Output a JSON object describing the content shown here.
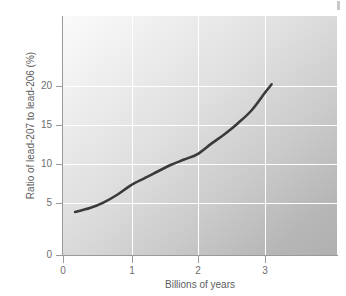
{
  "chart_data": {
    "type": "line",
    "title": "",
    "xlabel": "Billions of years",
    "ylabel": "Ratio of lead-207 to lead-206 (%)",
    "xlim": [
      0,
      4.05
    ],
    "ylim": [
      0,
      26
    ],
    "xticks": [
      0,
      1,
      2,
      3
    ],
    "xtick_labels": [
      "0",
      "1",
      "2",
      "3"
    ],
    "yticks": [
      0,
      5,
      10,
      15,
      20
    ],
    "ytick_labels": [
      "0",
      "5",
      "10",
      "15",
      "20"
    ],
    "grid": true,
    "grid_color": "#ffffff",
    "legend": null,
    "series": [
      {
        "name": "lead-207 / lead-206 ratio",
        "color": "#3a3a3a",
        "line_width": 2.6,
        "x": [
          0.18,
          0.4,
          0.6,
          0.8,
          1.0,
          1.2,
          1.4,
          1.6,
          1.8,
          2.0,
          2.2,
          2.4,
          2.6,
          2.8,
          3.0,
          3.1
        ],
        "y": [
          5.1,
          5.55,
          6.2,
          7.1,
          8.2,
          9.05,
          9.85,
          10.65,
          11.3,
          11.95,
          13.15,
          14.3,
          15.6,
          17.1,
          19.2,
          20.2
        ]
      }
    ],
    "annotations": []
  },
  "axes": {
    "y_tick_labels": [
      "20",
      "15",
      "10",
      "5",
      "0"
    ],
    "x_tick_labels": [
      "0",
      "1",
      "2",
      "3"
    ],
    "y_title": "Ratio of lead-207 to lead-206 (%)",
    "x_title": "Billions of years"
  },
  "colors": {
    "curve": "#3a3a3a",
    "axis": "#9a9a9a",
    "grid": "#ffffff",
    "tick_text": "#6e6e6e",
    "title_text": "#5d5d5d",
    "plot_light": "#fbfbfb",
    "plot_dark": "#b0b0b0"
  }
}
